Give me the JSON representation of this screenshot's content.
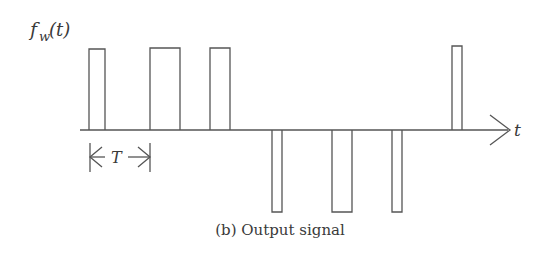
{
  "figure": {
    "y_label": "f",
    "y_label_sub": "w",
    "y_label_arg": "(t)",
    "x_label": "t",
    "period_label": "T",
    "caption": "(b) Output signal",
    "line_color": "#555555"
  },
  "axis": {
    "y": 130,
    "x_start": 80,
    "x_end": 510
  },
  "pulses": [
    {
      "x1": 89,
      "x2": 105,
      "level": 49,
      "sign": "positive"
    },
    {
      "x1": 150,
      "x2": 180,
      "level": 48,
      "sign": "positive"
    },
    {
      "x1": 210,
      "x2": 230,
      "level": 48,
      "sign": "positive"
    },
    {
      "x1": 272,
      "x2": 282,
      "level": 212,
      "sign": "negative"
    },
    {
      "x1": 332,
      "x2": 352,
      "level": 212,
      "sign": "negative"
    },
    {
      "x1": 392,
      "x2": 402,
      "level": 212,
      "sign": "negative"
    },
    {
      "x1": 452,
      "x2": 462,
      "level": 46,
      "sign": "positive"
    }
  ],
  "period_marker": {
    "x1": 90,
    "x2": 150,
    "y": 157
  }
}
